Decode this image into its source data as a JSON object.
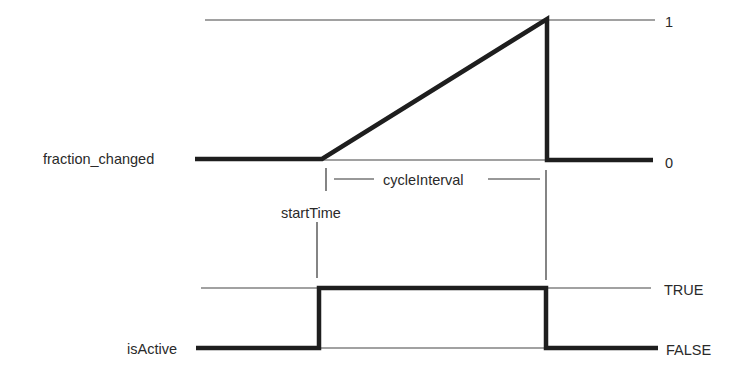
{
  "diagram": {
    "type": "timing-diagram",
    "signals": [
      {
        "name": "fraction_changed",
        "levels": {
          "high": "1",
          "low": "0"
        },
        "waveform": "0 until startTime, linear ramp to 1 over cycleInterval, then drop to 0"
      },
      {
        "name": "isActive",
        "levels": {
          "high": "TRUE",
          "low": "FALSE"
        },
        "waveform": "FALSE until startTime, TRUE during cycleInterval, then FALSE"
      }
    ],
    "annotations": {
      "start": "startTime",
      "interval": "cycleInterval"
    }
  },
  "labels": {
    "fraction_changed": "fraction_changed",
    "one": "1",
    "zero": "0",
    "cycle_interval": "cycleInterval",
    "start_time": "startTime",
    "is_active": "isActive",
    "true_label": "TRUE",
    "false_label": "FALSE"
  },
  "colors": {
    "line": "#1e1e1e",
    "thin_line": "#444444",
    "background": "#ffffff"
  }
}
